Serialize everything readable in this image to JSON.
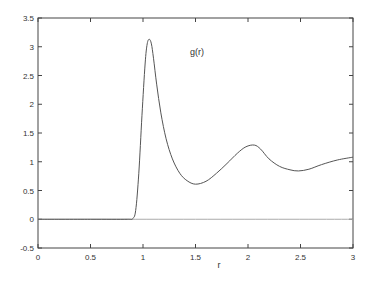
{
  "chart_data": {
    "type": "line",
    "title": "",
    "xlabel": "r",
    "ylabel": "",
    "xlim": [
      0,
      3
    ],
    "ylim": [
      -0.5,
      3.5
    ],
    "grid": false,
    "legend": {
      "position": "top-center-right",
      "entries": [
        "g(r)"
      ]
    },
    "x_ticks": [
      "0",
      "0.5",
      "1",
      "1.5",
      "2",
      "2.5",
      "3"
    ],
    "y_ticks": [
      "-0.5",
      "0",
      "0.5",
      "1",
      "1.5",
      "2",
      "2.5",
      "3",
      "3.5"
    ],
    "series": [
      {
        "name": "g(r)",
        "color": "#555555",
        "x": [
          0,
          0.5,
          0.85,
          0.9,
          0.93,
          0.96,
          0.99,
          1.02,
          1.04,
          1.06,
          1.08,
          1.1,
          1.13,
          1.17,
          1.22,
          1.28,
          1.35,
          1.42,
          1.5,
          1.6,
          1.7,
          1.8,
          1.9,
          1.98,
          2.06,
          2.12,
          2.2,
          2.3,
          2.4,
          2.48,
          2.58,
          2.7,
          2.85,
          3.0
        ],
        "values": [
          0,
          0,
          0,
          0.01,
          0.15,
          0.8,
          1.8,
          2.7,
          3.05,
          3.13,
          3.05,
          2.8,
          2.35,
          1.85,
          1.4,
          1.05,
          0.8,
          0.67,
          0.61,
          0.66,
          0.8,
          0.97,
          1.15,
          1.26,
          1.29,
          1.22,
          1.05,
          0.92,
          0.86,
          0.84,
          0.87,
          0.95,
          1.03,
          1.08
        ]
      },
      {
        "name": "baseline",
        "color": "#aaaaaa",
        "x": [
          0,
          3
        ],
        "values": [
          0,
          0
        ]
      }
    ]
  }
}
